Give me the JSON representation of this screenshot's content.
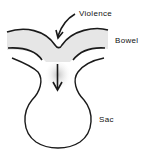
{
  "diagram": {
    "labels": {
      "violence": "Violence",
      "bowel": "Bowel",
      "sac": "Sac"
    },
    "colors": {
      "line": "#1a1a1a",
      "bowel_fill": "#e6e6e6",
      "stipple": "#9a9a9a",
      "background": "#ffffff"
    }
  }
}
